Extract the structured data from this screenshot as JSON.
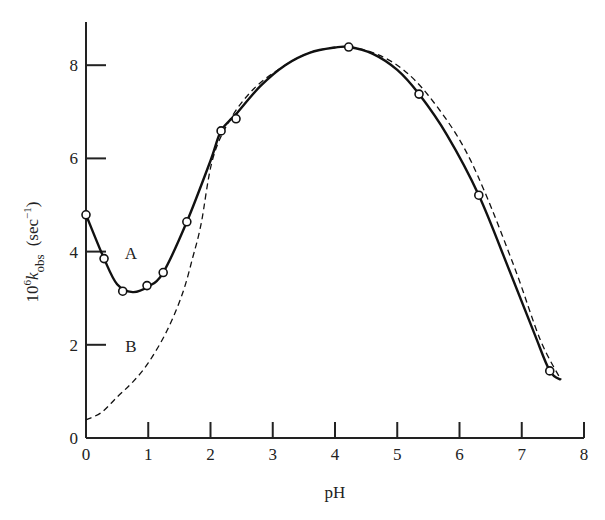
{
  "chart_data": {
    "type": "line",
    "title": "",
    "xlabel": "pH",
    "ylabel": "10^6 k_obs (sec^-1)",
    "ylabel_parts": {
      "prefix": "10",
      "prefix_sup": "6",
      "k": "k",
      "sub": "obs",
      "unit_open": "(sec",
      "unit_sup": "−1",
      "unit_close": ")"
    },
    "xlim": [
      0,
      8
    ],
    "ylim": [
      0,
      8.9
    ],
    "x_ticks": [
      0,
      1,
      2,
      3,
      4,
      5,
      6,
      7,
      8
    ],
    "x_tick_labels": [
      "0",
      "1",
      "2",
      "3",
      "4",
      "5",
      "6",
      "7",
      "8"
    ],
    "y_ticks": [
      0,
      2,
      4,
      6,
      8
    ],
    "y_tick_labels": [
      "0",
      "2",
      "4",
      "6",
      "8"
    ],
    "grid": false,
    "legend": "none (curves labeled inline)",
    "annotations": [
      {
        "text": "A",
        "x": 0.72,
        "y": 3.85
      },
      {
        "text": "B",
        "x": 0.72,
        "y": 1.85
      }
    ],
    "series": [
      {
        "name": "A (observed, solid line with open circles)",
        "style": "solid",
        "points": [
          {
            "x": 0.0,
            "y": 4.79
          },
          {
            "x": 0.29,
            "y": 3.85
          },
          {
            "x": 0.59,
            "y": 3.15
          },
          {
            "x": 0.98,
            "y": 3.27
          },
          {
            "x": 1.24,
            "y": 3.55
          },
          {
            "x": 1.62,
            "y": 4.64
          },
          {
            "x": 2.17,
            "y": 6.59
          },
          {
            "x": 2.41,
            "y": 6.85
          },
          {
            "x": 4.22,
            "y": 8.39
          },
          {
            "x": 5.35,
            "y": 7.38
          },
          {
            "x": 6.31,
            "y": 5.21
          },
          {
            "x": 7.45,
            "y": 1.44
          }
        ],
        "curve": [
          [
            0.0,
            4.79
          ],
          [
            0.29,
            3.85
          ],
          [
            0.5,
            3.3
          ],
          [
            0.75,
            3.13
          ],
          [
            1.0,
            3.25
          ],
          [
            1.24,
            3.55
          ],
          [
            1.62,
            4.64
          ],
          [
            2.0,
            5.95
          ],
          [
            2.17,
            6.59
          ],
          [
            2.41,
            6.95
          ],
          [
            2.8,
            7.55
          ],
          [
            3.2,
            8.0
          ],
          [
            3.6,
            8.27
          ],
          [
            4.0,
            8.38
          ],
          [
            4.22,
            8.39
          ],
          [
            4.6,
            8.25
          ],
          [
            5.0,
            7.9
          ],
          [
            5.35,
            7.38
          ],
          [
            5.8,
            6.5
          ],
          [
            6.31,
            5.21
          ],
          [
            6.8,
            3.6
          ],
          [
            7.2,
            2.25
          ],
          [
            7.45,
            1.44
          ],
          [
            7.63,
            1.25
          ]
        ]
      },
      {
        "name": "B (calculated, dashed line)",
        "style": "dashed",
        "curve": [
          [
            0.0,
            0.39
          ],
          [
            0.25,
            0.55
          ],
          [
            0.5,
            0.88
          ],
          [
            0.75,
            1.2
          ],
          [
            1.0,
            1.61
          ],
          [
            1.3,
            2.3
          ],
          [
            1.55,
            3.1
          ],
          [
            1.72,
            3.9
          ],
          [
            1.85,
            4.6
          ],
          [
            2.03,
            5.96
          ],
          [
            2.3,
            6.8
          ],
          [
            2.7,
            7.5
          ],
          [
            3.2,
            8.0
          ],
          [
            3.6,
            8.27
          ],
          [
            4.0,
            8.38
          ],
          [
            4.3,
            8.38
          ],
          [
            4.7,
            8.22
          ],
          [
            5.1,
            7.9
          ],
          [
            5.5,
            7.35
          ],
          [
            6.0,
            6.4
          ],
          [
            6.4,
            5.3
          ],
          [
            6.9,
            3.6
          ],
          [
            7.3,
            2.1
          ],
          [
            7.63,
            1.25
          ]
        ]
      }
    ]
  }
}
